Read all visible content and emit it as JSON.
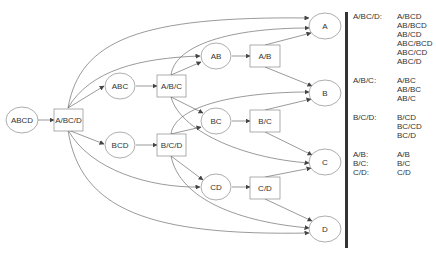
{
  "diagram": {
    "nodes": {
      "abcd": "ABCD",
      "a_bc_d": "A/BC/D",
      "abc": "ABC",
      "a_b_c": "A/B/C",
      "bcd": "BCD",
      "b_c_d": "B/C/D",
      "ab": "AB",
      "a_b": "A/B",
      "bc": "BC",
      "b_c": "B/C",
      "cd": "CD",
      "c_d": "C/D",
      "a": "A",
      "b": "B",
      "c": "C",
      "d": "D"
    }
  },
  "legend": {
    "groups": [
      {
        "key": "A/BC/D:",
        "values": [
          "A/BCD",
          "AB/BCD",
          "AB/CD",
          "ABC/BCD",
          "ABC/CD",
          "ABC/D"
        ]
      },
      {
        "key": "A/B/C:",
        "values": [
          "A/BC",
          "AB/BC",
          "AB/C"
        ]
      },
      {
        "key": "B/C/D:",
        "values": [
          "B/CD",
          "BC/CD",
          "BC/D"
        ]
      },
      {
        "key": "A/B:",
        "values": [
          "A/B"
        ]
      },
      {
        "key": "B/C:",
        "values": [
          "B/C"
        ]
      },
      {
        "key": "C/D:",
        "values": [
          "C/D"
        ]
      }
    ]
  }
}
